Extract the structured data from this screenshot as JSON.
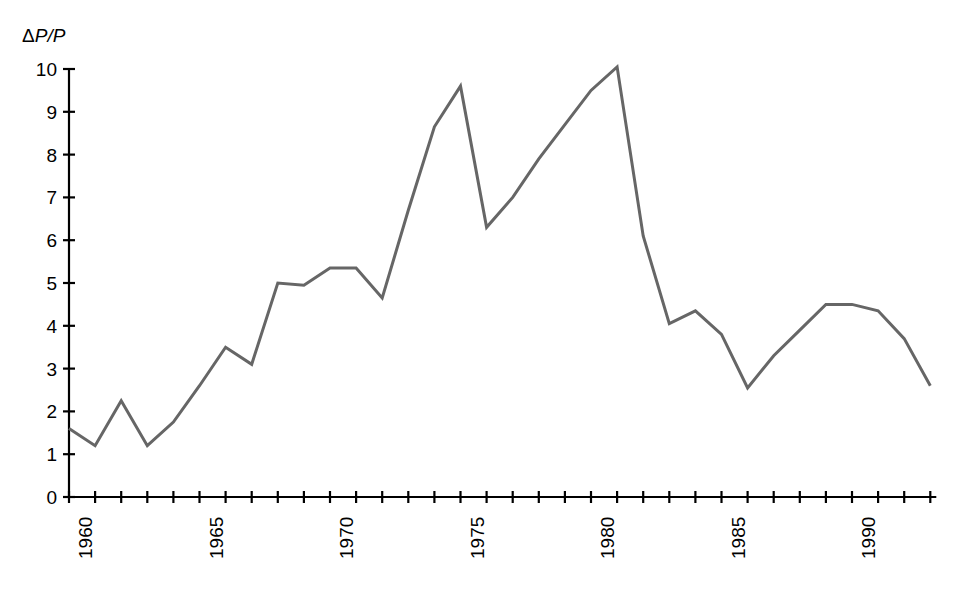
{
  "figure": {
    "background_color": "#ffffff",
    "axis_color": "#000000",
    "line_color": "#666666",
    "y_axis_label": "ΔP/P",
    "y_axis_label_parts": {
      "delta": "Δ",
      "p_over_p": "P/P"
    }
  },
  "chart_data": {
    "type": "line",
    "title": "",
    "subtitle": "",
    "xlabel": "",
    "ylabel": "ΔP/P",
    "grid": false,
    "legend": null,
    "xlim": [
      1960,
      1993
    ],
    "ylim": [
      0,
      10
    ],
    "y_ticks": [
      0,
      1,
      2,
      3,
      4,
      5,
      6,
      7,
      8,
      9,
      10
    ],
    "y_tick_labels": [
      "0",
      "1",
      "2",
      "3",
      "4",
      "5",
      "6",
      "7",
      "8",
      "9",
      "10"
    ],
    "x_ticks": [
      1960,
      1961,
      1962,
      1963,
      1964,
      1965,
      1966,
      1967,
      1968,
      1969,
      1970,
      1971,
      1972,
      1973,
      1974,
      1975,
      1976,
      1977,
      1978,
      1979,
      1980,
      1981,
      1982,
      1983,
      1984,
      1985,
      1986,
      1987,
      1988,
      1989,
      1990,
      1991,
      1992,
      1993
    ],
    "x_labeled_ticks": [
      1960,
      1965,
      1970,
      1975,
      1980,
      1985,
      1990
    ],
    "x_tick_labels": [
      "1960",
      "1965",
      "1970",
      "1975",
      "1980",
      "1985",
      "1990"
    ],
    "x_tick_label_rotation": -90,
    "series": [
      {
        "name": "ΔP/P",
        "color": "#666666",
        "line_width": 3,
        "x": [
          1960,
          1961,
          1962,
          1963,
          1964,
          1965,
          1966,
          1967,
          1968,
          1969,
          1970,
          1971,
          1972,
          1973,
          1974,
          1975,
          1976,
          1977,
          1978,
          1979,
          1980,
          1981,
          1982,
          1983,
          1984,
          1985,
          1986,
          1987,
          1988,
          1989,
          1990,
          1991,
          1992,
          1993
        ],
        "values": [
          1.6,
          1.2,
          2.25,
          1.2,
          1.75,
          2.6,
          3.5,
          3.1,
          5.0,
          4.95,
          5.35,
          5.35,
          4.65,
          6.7,
          8.65,
          9.6,
          6.3,
          7.0,
          7.9,
          8.7,
          9.5,
          10.05,
          6.1,
          4.05,
          4.35,
          3.8,
          2.55,
          3.3,
          3.9,
          4.5,
          4.5,
          4.35,
          3.7,
          2.6
        ]
      }
    ]
  }
}
